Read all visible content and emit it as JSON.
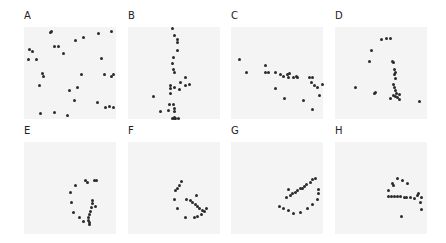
{
  "chart_data": [
    {
      "type": "scatter",
      "title": "A",
      "panel": {
        "x": 24,
        "y": 27
      },
      "label_pos": {
        "x": 24,
        "y": 11
      },
      "points": [
        [
          29,
          6
        ],
        [
          30,
          5
        ],
        [
          56,
          15
        ],
        [
          65,
          11
        ],
        [
          81,
          7
        ],
        [
          95,
          5
        ],
        [
          6,
          24
        ],
        [
          9,
          27
        ],
        [
          33,
          21
        ],
        [
          37,
          21
        ],
        [
          43,
          29
        ],
        [
          5,
          35
        ],
        [
          14,
          35
        ],
        [
          84,
          34
        ],
        [
          20,
          50
        ],
        [
          21,
          54
        ],
        [
          63,
          52
        ],
        [
          88,
          52
        ],
        [
          97,
          52
        ],
        [
          95,
          54
        ],
        [
          17,
          64
        ],
        [
          49,
          69
        ],
        [
          58,
          66
        ],
        [
          80,
          82
        ],
        [
          55,
          80
        ],
        [
          93,
          86
        ],
        [
          18,
          94
        ],
        [
          33,
          93
        ],
        [
          47,
          96
        ],
        [
          89,
          88
        ],
        [
          97,
          88
        ]
      ]
    },
    {
      "type": "scatter",
      "title": "B",
      "panel": {
        "x": 128,
        "y": 27
      },
      "label_pos": {
        "x": 128,
        "y": 11
      },
      "points": [
        [
          48,
          2
        ],
        [
          51,
          9
        ],
        [
          54,
          14
        ],
        [
          54,
          17
        ],
        [
          54,
          25
        ],
        [
          49,
          33
        ],
        [
          48,
          40
        ],
        [
          49,
          46
        ],
        [
          50,
          49
        ],
        [
          62,
          55
        ],
        [
          57,
          60
        ],
        [
          63,
          64
        ],
        [
          67,
          63
        ],
        [
          46,
          64
        ],
        [
          46,
          67
        ],
        [
          51,
          66
        ],
        [
          56,
          68
        ],
        [
          46,
          72
        ],
        [
          28,
          75
        ],
        [
          45,
          84
        ],
        [
          49,
          84
        ],
        [
          50,
          89
        ],
        [
          35,
          92
        ],
        [
          44,
          91
        ],
        [
          50,
          92
        ],
        [
          50,
          98
        ],
        [
          52,
          99
        ],
        [
          55,
          99
        ],
        [
          48,
          101
        ],
        [
          50,
          101
        ]
      ]
    },
    {
      "type": "scatter",
      "title": "C",
      "panel": {
        "x": 231,
        "y": 27
      },
      "label_pos": {
        "x": 231,
        "y": 11
      },
      "points": [
        [
          9,
          35
        ],
        [
          17,
          49
        ],
        [
          37,
          42
        ],
        [
          37,
          49
        ],
        [
          41,
          49
        ],
        [
          48,
          49
        ],
        [
          54,
          52
        ],
        [
          57,
          54
        ],
        [
          61,
          52
        ],
        [
          63,
          55
        ],
        [
          64,
          51
        ],
        [
          68,
          55
        ],
        [
          71,
          54
        ],
        [
          72,
          55
        ],
        [
          85,
          55
        ],
        [
          89,
          55
        ],
        [
          88,
          60
        ],
        [
          91,
          64
        ],
        [
          94,
          66
        ],
        [
          100,
          62
        ],
        [
          48,
          67
        ],
        [
          58,
          78
        ],
        [
          79,
          80
        ],
        [
          89,
          90
        ],
        [
          96,
          74
        ]
      ]
    },
    {
      "type": "scatter",
      "title": "D",
      "panel": {
        "x": 335,
        "y": 27
      },
      "label_pos": {
        "x": 335,
        "y": 11
      },
      "points": [
        [
          51,
          14
        ],
        [
          56,
          13
        ],
        [
          60,
          12
        ],
        [
          40,
          25
        ],
        [
          37,
          38
        ],
        [
          63,
          38
        ],
        [
          64,
          39
        ],
        [
          65,
          46
        ],
        [
          66,
          49
        ],
        [
          65,
          52
        ],
        [
          66,
          56
        ],
        [
          64,
          62
        ],
        [
          65,
          66
        ],
        [
          66,
          69
        ],
        [
          67,
          72
        ],
        [
          70,
          73
        ],
        [
          64,
          74
        ],
        [
          66,
          75
        ],
        [
          68,
          77
        ],
        [
          70,
          79
        ],
        [
          22,
          66
        ],
        [
          44,
          71
        ],
        [
          43,
          72
        ],
        [
          60,
          78
        ],
        [
          92,
          81
        ]
      ]
    },
    {
      "type": "scatter",
      "title": "E",
      "panel": {
        "x": 24,
        "y": 142
      },
      "label_pos": {
        "x": 24,
        "y": 126
      },
      "points": [
        [
          67,
          42
        ],
        [
          69,
          44
        ],
        [
          77,
          42
        ],
        [
          79,
          42
        ],
        [
          56,
          47
        ],
        [
          51,
          55
        ],
        [
          52,
          66
        ],
        [
          74,
          64
        ],
        [
          74,
          67
        ],
        [
          73,
          71
        ],
        [
          72,
          75
        ],
        [
          71,
          79
        ],
        [
          70,
          82
        ],
        [
          70,
          85
        ],
        [
          71,
          88
        ],
        [
          71,
          90
        ],
        [
          65,
          86
        ],
        [
          60,
          82
        ],
        [
          54,
          77
        ],
        [
          78,
          70
        ]
      ]
    },
    {
      "type": "scatter",
      "title": "F",
      "panel": {
        "x": 128,
        "y": 142
      },
      "label_pos": {
        "x": 128,
        "y": 126
      },
      "points": [
        [
          58,
          43
        ],
        [
          56,
          47
        ],
        [
          54,
          51
        ],
        [
          52,
          53
        ],
        [
          51,
          62
        ],
        [
          54,
          72
        ],
        [
          62,
          82
        ],
        [
          72,
          82
        ],
        [
          76,
          81
        ],
        [
          80,
          79
        ],
        [
          83,
          76
        ],
        [
          81,
          74
        ],
        [
          78,
          72
        ],
        [
          76,
          70
        ],
        [
          73,
          68
        ],
        [
          70,
          66
        ],
        [
          68,
          64
        ],
        [
          64,
          62
        ],
        [
          74,
          58
        ],
        [
          85,
          72
        ]
      ]
    },
    {
      "type": "scatter",
      "title": "G",
      "panel": {
        "x": 231,
        "y": 142
      },
      "label_pos": {
        "x": 231,
        "y": 126
      },
      "points": [
        [
          92,
          40
        ],
        [
          89,
          41
        ],
        [
          86,
          44
        ],
        [
          82,
          46
        ],
        [
          80,
          48
        ],
        [
          78,
          50
        ],
        [
          75,
          51
        ],
        [
          72,
          53
        ],
        [
          70,
          55
        ],
        [
          67,
          56
        ],
        [
          65,
          58
        ],
        [
          63,
          52
        ],
        [
          95,
          52
        ],
        [
          95,
          56
        ],
        [
          94,
          63
        ],
        [
          89,
          68
        ],
        [
          83,
          72
        ],
        [
          76,
          77
        ],
        [
          68,
          78
        ],
        [
          62,
          74
        ],
        [
          57,
          72
        ],
        [
          53,
          70
        ],
        [
          60,
          60
        ]
      ]
    },
    {
      "type": "scatter",
      "title": "H",
      "panel": {
        "x": 335,
        "y": 142
      },
      "label_pos": {
        "x": 335,
        "y": 126
      },
      "points": [
        [
          68,
          40
        ],
        [
          73,
          42
        ],
        [
          79,
          45
        ],
        [
          62,
          45
        ],
        [
          64,
          47
        ],
        [
          58,
          53
        ],
        [
          91,
          56
        ],
        [
          90,
          58
        ],
        [
          94,
          60
        ],
        [
          58,
          59
        ],
        [
          61,
          59
        ],
        [
          65,
          59
        ],
        [
          68,
          59
        ],
        [
          71,
          59
        ],
        [
          75,
          60
        ],
        [
          78,
          60
        ],
        [
          82,
          60
        ],
        [
          86,
          61
        ],
        [
          93,
          66
        ],
        [
          94,
          73
        ],
        [
          72,
          81
        ]
      ]
    }
  ],
  "colors": {
    "panel_bg": "#f4f4f4",
    "dot": "#2b2b2b",
    "label": "#222222"
  }
}
